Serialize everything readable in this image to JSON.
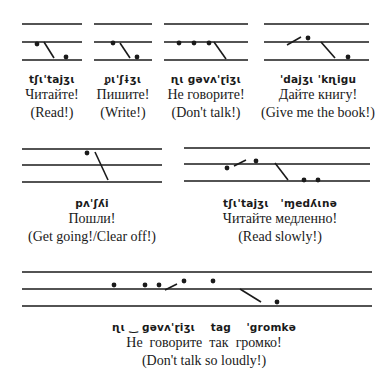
{
  "examples": [
    {
      "transcription": "tʃɩ'tajʒɩ",
      "russian": "Читайте!",
      "english": "(Read!)",
      "cx": 52,
      "ty": 73
    },
    {
      "transcription": "ᵱɩ'ʃɨʒɩ",
      "russian": "Пишите!",
      "english": "(Write!)",
      "cx": 123,
      "ty": 73
    },
    {
      "transcription": "ɳɩ ɡəvʌ'ɽiʒɩ",
      "russian": "Не говорите!",
      "english": "(Don't talk!)",
      "cx": 206,
      "ty": 73
    },
    {
      "transcription": "'dajʒɩ 'kɳigu",
      "russian": "Дайте книгу!",
      "english": "(Give me the book!)",
      "cx": 318,
      "ty": 73
    },
    {
      "transcription": "pʌ'ʃʎi",
      "russian": "Пошли!",
      "english": "(Get going!/Clear off!)",
      "cx": 92,
      "ty": 197
    },
    {
      "transcription": "tʃɩ'tajʒɩ   'ɱedʎɩnə",
      "russian": "Читайте медленно!",
      "english": "(Read slowly!)",
      "cx": 280,
      "ty": 197
    },
    {
      "transcription": "ɳɩ ‿ ɡəvʌ'ɽiʒɩ    tag    'gromkə",
      "russian": "Не  говорите  так  громко!",
      "english": "(Don't talk so loudly!)",
      "cx": 204,
      "ty": 321
    }
  ],
  "staves": [
    {
      "x1": 22,
      "x2": 82,
      "y": [
        24,
        42,
        60
      ]
    },
    {
      "x1": 94,
      "x2": 152,
      "y": [
        24,
        42,
        60
      ]
    },
    {
      "x1": 164,
      "x2": 248,
      "y": [
        24,
        42,
        60
      ]
    },
    {
      "x1": 264,
      "x2": 369,
      "y": [
        24,
        42,
        60
      ]
    },
    {
      "x1": 22,
      "x2": 162,
      "y": [
        149,
        165,
        182
      ]
    },
    {
      "x1": 184,
      "x2": 370,
      "y": [
        148,
        164,
        181
      ]
    },
    {
      "x1": 22,
      "x2": 372,
      "y": [
        272,
        289,
        306
      ]
    }
  ],
  "dots": [
    [
      37,
      44
    ],
    [
      66,
      57
    ],
    [
      113,
      43
    ],
    [
      137,
      57
    ],
    [
      179,
      43
    ],
    [
      194,
      43
    ],
    [
      209,
      43
    ],
    [
      308,
      38
    ],
    [
      348,
      57
    ],
    [
      87,
      153
    ],
    [
      227,
      168
    ],
    [
      256,
      161
    ],
    [
      304,
      180
    ],
    [
      318,
      180
    ],
    [
      114,
      285
    ],
    [
      145,
      285
    ],
    [
      159,
      285
    ],
    [
      184,
      281
    ],
    [
      213,
      281
    ],
    [
      277,
      302
    ]
  ],
  "strokes": [
    [
      44,
      42,
      54,
      58
    ],
    [
      120,
      43,
      130,
      58
    ],
    [
      214,
      42,
      226,
      59
    ],
    [
      287,
      45,
      301,
      37
    ],
    [
      321,
      42,
      335,
      58
    ],
    [
      95,
      152,
      108,
      180
    ],
    [
      234,
      166,
      246,
      160
    ],
    [
      275,
      163,
      288,
      180
    ],
    [
      165,
      290,
      177,
      284
    ],
    [
      240,
      289,
      261,
      302
    ]
  ],
  "colors": {
    "ink": "#1a1a1a",
    "background": "#ffffff"
  }
}
